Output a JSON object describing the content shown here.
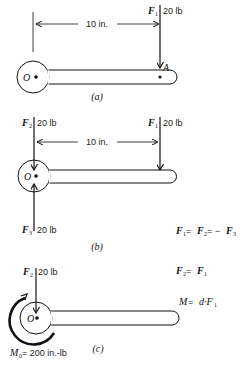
{
  "figure_a": {
    "caption": "(a)",
    "dimension": "10 in.",
    "force": {
      "name": "F",
      "sub": "1",
      "magnitude": "20 lb"
    },
    "pivot": "O",
    "point": "A"
  },
  "figure_b": {
    "caption": "(b)",
    "dimension": "10 in.",
    "forces": [
      {
        "name": "F",
        "sub": "2",
        "magnitude": "20 lb"
      },
      {
        "name": "F",
        "sub": "1",
        "magnitude": "20 lb"
      },
      {
        "name": "F",
        "sub": "3",
        "magnitude": "20 lb"
      }
    ],
    "pivot": "O",
    "equation": {
      "parts": [
        "F",
        "1",
        " = ",
        "F",
        "2",
        " = − ",
        "F",
        "3"
      ]
    }
  },
  "figure_c": {
    "caption": "(c)",
    "force": {
      "name": "F",
      "sub": "2",
      "magnitude": "20 lb"
    },
    "pivot": "O",
    "eq1": {
      "lhs": "F",
      "lhs_sub": "2",
      "op": " = ",
      "rhs": "F",
      "rhs_sub": "1"
    },
    "eq2": {
      "lhs": "M",
      "op": " = ",
      "rhs": "d·F",
      "rhs_sub": "1"
    },
    "moment": {
      "name": "M",
      "sub": "0",
      "value": " = 200 in.-lb"
    }
  },
  "colors": {
    "line": "#111111",
    "background": "#ffffff"
  }
}
